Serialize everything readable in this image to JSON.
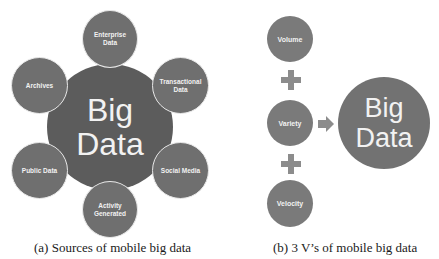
{
  "panel_a": {
    "center": {
      "line1": "Big",
      "line2": "Data"
    },
    "sources": [
      {
        "label": "Enterprise Data",
        "line1": "Enterprise",
        "line2": "Data"
      },
      {
        "label": "Transactional Data",
        "line1": "Transactional",
        "line2": "Data"
      },
      {
        "label": "Social Media",
        "line1": "Social Media",
        "line2": ""
      },
      {
        "label": "Activity Generated",
        "line1": "Activity",
        "line2": "Generated"
      },
      {
        "label": "Public Data",
        "line1": "Public Data",
        "line2": ""
      },
      {
        "label": "Archives",
        "line1": "Archives",
        "line2": ""
      }
    ],
    "caption": "(a)  Sources of mobile big data"
  },
  "panel_b": {
    "vs": [
      {
        "label": "Volume"
      },
      {
        "label": "Variety"
      },
      {
        "label": "Velocity"
      }
    ],
    "operator": "plus",
    "result_arrow": "right-arrow",
    "result": {
      "line1": "Big",
      "line2": "Data"
    },
    "caption": "(b)  3 V’s of mobile big data"
  },
  "colors": {
    "big_circle": "#5c5c5c",
    "small_circle": "#6f6f6f",
    "v_circle": "#7a7a7a",
    "text": "#f2f2f2",
    "operator": "#8c8c8c"
  }
}
